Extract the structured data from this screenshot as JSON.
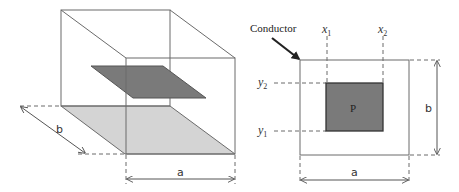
{
  "left_diagram": {
    "dimension_a": "a",
    "dimension_b": "b"
  },
  "right_diagram": {
    "conductor_label": "Conductor",
    "x1_label": "x",
    "x1_sub": "1",
    "x2_label": "x",
    "x2_sub": "2",
    "y1_label": "y",
    "y1_sub": "1",
    "y2_label": "y",
    "y2_sub": "2",
    "plate_label": "P",
    "dimension_a": "a",
    "dimension_b": "b"
  },
  "colors": {
    "line": "#6b6b6b",
    "dark_plate": "#7a7a7a",
    "light_plate": "#d4d4d4",
    "text": "#333333"
  }
}
